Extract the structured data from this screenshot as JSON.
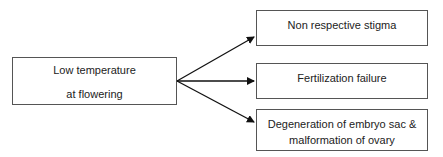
{
  "diagram": {
    "source": {
      "line1": "Low temperature",
      "line2": "at flowering"
    },
    "targets": [
      {
        "label": "Non respective stigma"
      },
      {
        "label": "Fertilization failure"
      },
      {
        "label": "Degeneration of embryo sac & malformation of ovary"
      }
    ],
    "edges": [
      {
        "from": "source",
        "to": 0
      },
      {
        "from": "source",
        "to": 1
      },
      {
        "from": "source",
        "to": 2
      }
    ]
  }
}
